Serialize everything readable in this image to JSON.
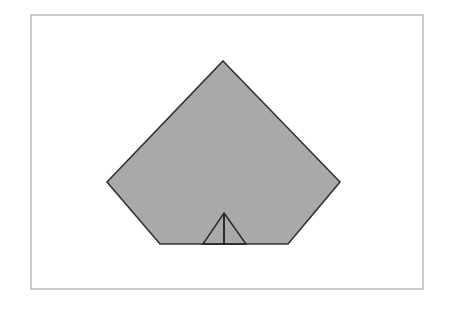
{
  "page": {
    "background_color": "#ffffff",
    "width": 451,
    "height": 309
  },
  "frame": {
    "name": "figure-border",
    "x": 31,
    "y": 15,
    "width": 392,
    "height": 274,
    "stroke_color": "#b4b4b4",
    "stroke_width": 1.4,
    "fill_color": "#ffffff"
  },
  "shape": {
    "label": "folded-paper-kite",
    "fill_color": "#a9a9a9",
    "stroke_color": "#333333",
    "stroke_width": 1.6,
    "outline_points": "223,61 340,182 288,244 160,244 107,182",
    "vertices": [
      {
        "name": "apex-top",
        "x": 223,
        "y": 61
      },
      {
        "name": "right-shoulder",
        "x": 340,
        "y": 182
      },
      {
        "name": "bottom-right",
        "x": 288,
        "y": 244
      },
      {
        "name": "bottom-left",
        "x": 160,
        "y": 244
      },
      {
        "name": "left-shoulder",
        "x": 107,
        "y": 182
      }
    ]
  },
  "flap": {
    "label": "bottom-center-triangle-flap",
    "fill_color": "#a9a9a9",
    "stroke_color": "#2b2b2b",
    "stroke_width": 1.5,
    "points": "224,213 246,244 203,244",
    "vertices": [
      {
        "name": "flap-apex",
        "x": 224,
        "y": 213
      },
      {
        "name": "flap-foot-right",
        "x": 246,
        "y": 244
      },
      {
        "name": "flap-foot-left",
        "x": 203,
        "y": 244
      }
    ]
  },
  "crease": {
    "label": "vertical-center-crease",
    "stroke_color": "#2b2b2b",
    "stroke_width": 2.0,
    "x1": 224,
    "y1": 213,
    "x2": 224,
    "y2": 245
  },
  "base_line": {
    "label": "flap-base-line",
    "stroke_color": "#2b2b2b",
    "stroke_width": 1.5,
    "x1": 203,
    "y1": 244,
    "x2": 246,
    "y2": 244
  }
}
